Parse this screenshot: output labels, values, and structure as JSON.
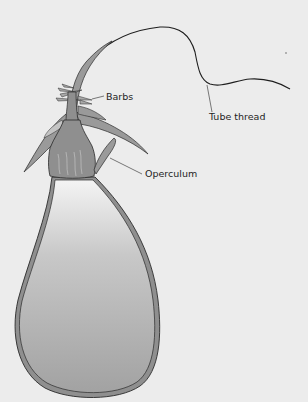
{
  "diagram": {
    "colors": {
      "background": "#ececec",
      "fill_dark": "#8f8f8f",
      "fill_mid": "#a8a8a8",
      "fill_light": "#f2f2f2",
      "outline": "#2a2a2a",
      "leader_line": "#444444"
    },
    "labels": [
      {
        "id": "barbs",
        "text": "Barbs"
      },
      {
        "id": "tube_thread",
        "text": "Tube thread"
      },
      {
        "id": "operculum",
        "text": "Operculum"
      }
    ]
  }
}
